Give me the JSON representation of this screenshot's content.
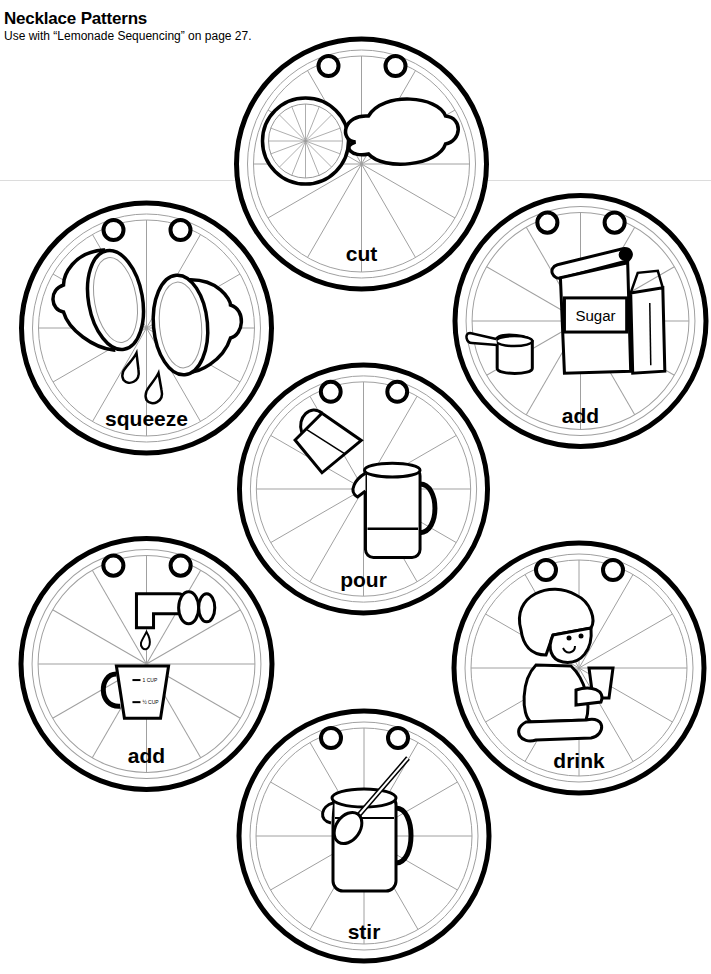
{
  "header": {
    "title": "Necklace Patterns",
    "subtitle": "Use with “Lemonade Sequencing” on page 27."
  },
  "patterns": [
    {
      "id": "cut",
      "label": "cut",
      "icon": "lemon-cut-icon"
    },
    {
      "id": "squeeze",
      "label": "squeeze",
      "icon": "lemon-squeeze-icon"
    },
    {
      "id": "add-sugar",
      "label": "add",
      "icon": "sugar-bag-icon",
      "icon_text": "Sugar"
    },
    {
      "id": "pour",
      "label": "pour",
      "icon": "pour-pitcher-icon"
    },
    {
      "id": "add-water",
      "label": "add",
      "icon": "faucet-measuring-cup-icon",
      "cup_marks": [
        "1 CUP",
        "½ CUP"
      ]
    },
    {
      "id": "drink",
      "label": "drink",
      "icon": "child-drinking-icon"
    },
    {
      "id": "stir",
      "label": "stir",
      "icon": "pitcher-spoon-icon"
    }
  ],
  "colors": {
    "ink": "#000000",
    "segment_line": "#a0a0a0",
    "paper": "#ffffff"
  }
}
